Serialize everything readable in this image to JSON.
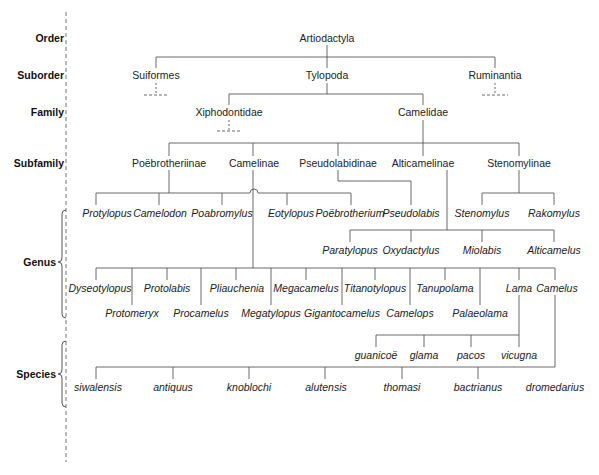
{
  "diagram": {
    "ranks": [
      {
        "label": "Order",
        "y": 38
      },
      {
        "label": "Suborder",
        "y": 75
      },
      {
        "label": "Family",
        "y": 112
      },
      {
        "label": "Subfamily",
        "y": 163
      },
      {
        "label": "Genus",
        "y": 262
      },
      {
        "label": "Species",
        "y": 374
      }
    ],
    "order": {
      "label": "Artiodactyla"
    },
    "suborders": [
      {
        "label": "Suiformes"
      },
      {
        "label": "Tylopoda"
      },
      {
        "label": "Ruminantia"
      }
    ],
    "families": [
      {
        "label": "Xiphodontidae"
      },
      {
        "label": "Camelidae"
      }
    ],
    "subfamilies": [
      {
        "label": "Poëbrotheriinae"
      },
      {
        "label": "Camelinae"
      },
      {
        "label": "Pseudolabidinae"
      },
      {
        "label": "Alticamelinae"
      },
      {
        "label": "Stenomylinae"
      }
    ],
    "genera": {
      "poebrotheriinae": [
        "Protylopus",
        "Camelodon",
        "Poabromylus",
        "Eotylopus",
        "Poëbrotherium"
      ],
      "pseudolabidinae": [
        "Pseudolabis"
      ],
      "stenomylinae": [
        "Stenomylus",
        "Rakomylus"
      ],
      "alticamelinae": [
        "Paratylopus",
        "Oxydactylus",
        "Miolabis",
        "Alticamelus"
      ],
      "camelinae": [
        "Dyseotylopus",
        "Protomeryx",
        "Protolabis",
        "Procamelus",
        "Pliauchenia",
        "Megatylopus",
        "Megacamelus",
        "Gigantocamelus",
        "Titanotylopus",
        "Camelops",
        "Tanupolama",
        "Palaeolama",
        "Lama",
        "Camelus"
      ]
    },
    "species": {
      "lama": [
        "guanicoë",
        "glama",
        "pacos",
        "vicugna"
      ],
      "camelus": [
        "siwalensis",
        "antiquus",
        "knoblochi",
        "alutensis",
        "thomasi",
        "bactrianus",
        "dromedarius"
      ]
    },
    "colors": {
      "line": "#5a5a5a",
      "text": "#222222",
      "background": "#ffffff"
    }
  }
}
